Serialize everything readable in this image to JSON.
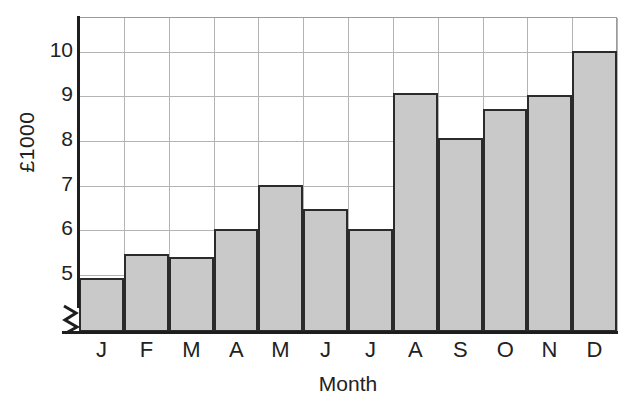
{
  "chart_data": {
    "type": "bar",
    "title": "",
    "xlabel": "Month",
    "ylabel": "£1000",
    "categories": [
      "J",
      "F",
      "M",
      "A",
      "M",
      "J",
      "J",
      "A",
      "S",
      "O",
      "N",
      "D"
    ],
    "category_names": [
      "January",
      "February",
      "March",
      "April",
      "May",
      "June",
      "July",
      "August",
      "September",
      "October",
      "November",
      "December"
    ],
    "values": [
      4.9,
      5.45,
      5.38,
      6.0,
      7.0,
      6.45,
      6.0,
      9.05,
      8.05,
      8.7,
      9.0,
      10.0
    ],
    "ylim": [
      3.7,
      10.75
    ],
    "ytick_labels": [
      "10",
      "9",
      "8",
      "7",
      "6",
      "5"
    ],
    "ytick_values": [
      10,
      9,
      8,
      7,
      6,
      5
    ],
    "gridlines_y": [
      10,
      9,
      8,
      7,
      6,
      5,
      4
    ],
    "grid": true,
    "legend": "none",
    "axis_break": true,
    "axis_break_note": "zigzag break on y-axis below 4",
    "bar_fill_color": "#c9c9c9",
    "bar_border_color": "#2b2b2b",
    "gridline_color": "#b4b4b4",
    "axis_color": "#1e1e1e",
    "background_color": "#ffffff"
  }
}
